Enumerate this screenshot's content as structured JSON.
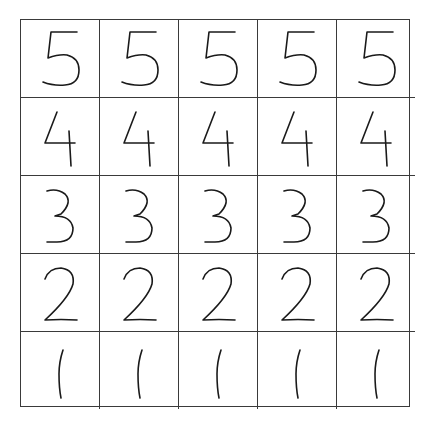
{
  "worksheet": {
    "rows": [
      {
        "digit": "5",
        "cells": [
          "5",
          "5",
          "5",
          "5",
          "5"
        ]
      },
      {
        "digit": "4",
        "cells": [
          "4",
          "4",
          "4",
          "4",
          "4"
        ]
      },
      {
        "digit": "3",
        "cells": [
          "3",
          "3",
          "3",
          "3",
          "3"
        ]
      },
      {
        "digit": "2",
        "cells": [
          "2",
          "2",
          "2",
          "2",
          "2"
        ]
      },
      {
        "digit": "1",
        "cells": [
          "1",
          "1",
          "1",
          "1",
          "1"
        ]
      }
    ],
    "grid": {
      "columns": 5,
      "rows": 5,
      "line_color": "#3a3a3a",
      "ink_color": "#1a1a1a"
    }
  }
}
